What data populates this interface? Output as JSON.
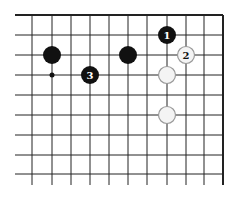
{
  "diagram": {
    "type": "go-board-fragment",
    "grid": {
      "x_lines": [
        32,
        52,
        71,
        90,
        109,
        128,
        147,
        167,
        186,
        204,
        223
      ],
      "y_lines": [
        15,
        35,
        55,
        75,
        95,
        115,
        135,
        155,
        174
      ],
      "h_start": 15,
      "h_end": 223,
      "v_start": 15,
      "v_end": 185,
      "edges": [
        "top",
        "right"
      ]
    },
    "stones": [
      {
        "color": "black",
        "x": 52,
        "y": 55,
        "label": ""
      },
      {
        "color": "black",
        "x": 128,
        "y": 55,
        "label": ""
      },
      {
        "color": "black",
        "x": 167,
        "y": 35,
        "label": "1"
      },
      {
        "color": "white",
        "x": 186,
        "y": 55,
        "label": "2"
      },
      {
        "color": "black",
        "x": 90,
        "y": 75,
        "label": "3"
      },
      {
        "color": "white",
        "x": 167,
        "y": 75,
        "label": ""
      },
      {
        "color": "white",
        "x": 167,
        "y": 115,
        "label": ""
      }
    ],
    "markers": [
      {
        "type": "dot",
        "x": 52,
        "y": 75
      }
    ],
    "colors": {
      "line": "#222222",
      "black_stone": "#111111",
      "white_stone": "#f4f4f4",
      "white_stroke": "#999999"
    }
  }
}
